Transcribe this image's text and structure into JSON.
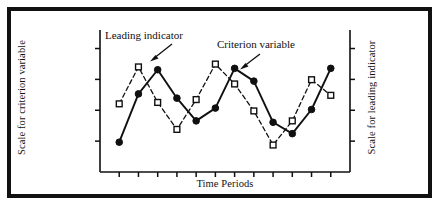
{
  "figure": {
    "background_color": "#ffffff",
    "border_color": "#111111",
    "ink_color": "#101010"
  },
  "chart_data": {
    "type": "line",
    "title": "",
    "subtitle": "",
    "xlabel": "Time Periods",
    "ylabel": "Scale for criterion variable",
    "ylabel_right": "Scale for leading indicator",
    "grid": false,
    "legend_position": "inline-annotations",
    "axis_ticks": {
      "x_tick_count": 12,
      "y_left_tick_count": 4,
      "y_right_tick_count": 4,
      "x_tick_labels": [],
      "y_tick_labels": []
    },
    "xlim": [
      0,
      13
    ],
    "ylim": [
      0,
      10
    ],
    "x": [
      1,
      2,
      3,
      4,
      5,
      6,
      7,
      8,
      9,
      10,
      11,
      12
    ],
    "series": [
      {
        "name": "Criterion variable",
        "style": "solid",
        "marker": "filled-circle",
        "color": "#101010",
        "values": [
          2.1,
          5.5,
          7.2,
          5.2,
          3.6,
          4.5,
          7.3,
          6.4,
          3.5,
          2.7,
          4.4,
          7.3
        ]
      },
      {
        "name": "Leading indicator",
        "style": "dashed",
        "marker": "open-square",
        "color": "#101010",
        "values": [
          4.8,
          7.4,
          4.9,
          3.0,
          5.1,
          7.6,
          6.2,
          4.3,
          1.9,
          3.6,
          6.5,
          5.4
        ]
      }
    ],
    "annotations": [
      {
        "text": "Leading indicator",
        "points_to": "leading-indicator-point-2",
        "arrow": "down-left"
      },
      {
        "text": "Criterion variable",
        "points_to": "criterion-variable-point-7",
        "arrow": "down-left"
      }
    ]
  }
}
